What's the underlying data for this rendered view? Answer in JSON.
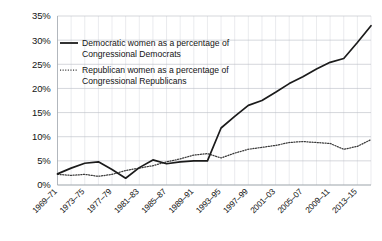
{
  "chart_data": {
    "type": "line",
    "title": "",
    "subtitle": "",
    "xlabel": "",
    "ylabel": "",
    "grid": true,
    "legend_position": "top-left-inside",
    "ylim": [
      0,
      35
    ],
    "yticks": [
      0,
      5,
      10,
      15,
      20,
      25,
      30,
      35
    ],
    "ytick_labels": [
      "0%",
      "5%",
      "10%",
      "15%",
      "20%",
      "25%",
      "30%",
      "35%"
    ],
    "categories": [
      "1969–71",
      "1971–73",
      "1973–75",
      "1975–77",
      "1977–79",
      "1979–81",
      "1981–83",
      "1983–85",
      "1985–87",
      "1987–89",
      "1989–91",
      "1991–93",
      "1993–95",
      "1995–97",
      "1997–99",
      "1999–01",
      "2001–03",
      "2003–05",
      "2005–07",
      "2007–09",
      "2009–11",
      "2011–13",
      "2013–15",
      "2015–17"
    ],
    "xtick_labels": [
      "1969–71",
      "1973–75",
      "1977–79",
      "1981–83",
      "1985–87",
      "1989–91",
      "1993–95",
      "1997–99",
      "2001–03",
      "2005–07",
      "2009–11",
      "2013–15"
    ],
    "xtick_indices": [
      0,
      2,
      4,
      6,
      8,
      10,
      12,
      14,
      16,
      18,
      20,
      22
    ],
    "series": [
      {
        "name": "Democratic women as a percentage of Congressional Democrats",
        "style": "solid",
        "color": "#1b1b1b",
        "values": [
          2.3,
          3.5,
          4.5,
          4.8,
          3.2,
          1.4,
          3.6,
          5.2,
          4.4,
          4.8,
          5.0,
          5.0,
          11.8,
          14.2,
          16.5,
          17.5,
          19.2,
          21.0,
          22.4,
          24.0,
          25.4,
          26.2,
          29.5,
          33.0
        ]
      },
      {
        "name": "Republican women as a percentage of Congressional Republicans",
        "style": "dotted",
        "color": "#3a3a3a",
        "values": [
          2.2,
          2.0,
          2.2,
          1.8,
          2.2,
          3.0,
          3.5,
          4.0,
          4.8,
          5.4,
          6.2,
          6.5,
          5.6,
          6.6,
          7.4,
          7.8,
          8.2,
          8.8,
          9.0,
          8.8,
          8.6,
          7.4,
          8.0,
          9.4
        ]
      }
    ],
    "legend": [
      {
        "style": "solid",
        "line1": "Democratic women as a percentage of",
        "line2": "Congressional Democrats"
      },
      {
        "style": "dotted",
        "line1": "Republican women as a percentage of",
        "line2": "Congressional Republicans"
      }
    ]
  }
}
